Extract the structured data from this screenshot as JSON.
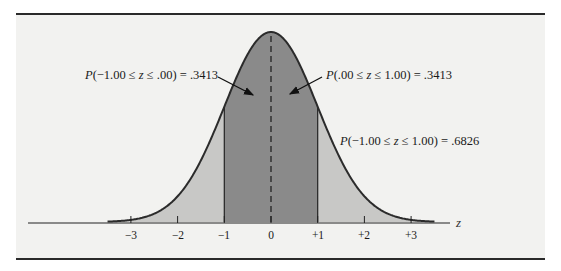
{
  "chart_data": {
    "type": "area",
    "xlabel": "z",
    "ylabel": "",
    "x_ticks": [
      "-3",
      "-2",
      "-1",
      "0",
      "+1",
      "+2",
      "+3"
    ],
    "xlim": [
      -3.5,
      3.5
    ],
    "grid": false,
    "regions": [
      {
        "name": "P(-1.00 <= z <= .00)",
        "from": -1.0,
        "to": 0.0,
        "value": 0.3413,
        "shade": "dark"
      },
      {
        "name": "P(.00 <= z <= 1.00)",
        "from": 0.0,
        "to": 1.0,
        "value": 0.3413,
        "shade": "dark"
      },
      {
        "name": "P(-1.00 <= z <= 1.00)",
        "from": -1.0,
        "to": 1.0,
        "value": 0.6826,
        "shade": "dark"
      },
      {
        "name": "tails",
        "from": -3.5,
        "to": -1.0,
        "shade": "light"
      },
      {
        "name": "tails",
        "from": 1.0,
        "to": 3.5,
        "shade": "light"
      }
    ],
    "annotations": [
      "P(−1.00 ≤ z ≤ .00) = .3413",
      "P(.00 ≤ z ≤ 1.00) = .3413",
      "P(−1.00 ≤ z ≤ 1.00) = .6826"
    ],
    "mean_line": {
      "x": 0,
      "style": "dashed"
    }
  },
  "labels": {
    "left": {
      "p": "P",
      "rest": "(−1.00 ≤ ",
      "z": "z",
      "tail": " ≤ .00) = .3413"
    },
    "right": {
      "p": "P",
      "rest": "(.00 ≤ ",
      "z": "z",
      "tail": " ≤ 1.00) = .3413"
    },
    "total": {
      "p": "P",
      "rest": "(−1.00 ≤ ",
      "z": "z",
      "tail": " ≤ 1.00) = .6826"
    }
  },
  "axis": {
    "ticks": [
      "−3",
      "−2",
      "−1",
      "0",
      "+1",
      "+2",
      "+3"
    ],
    "var": "z"
  },
  "colors": {
    "dark_fill": "#8a8a8a",
    "light_fill": "#c8c8c6",
    "curve": "#2b2b2b",
    "panel": "#f2f2f0"
  }
}
